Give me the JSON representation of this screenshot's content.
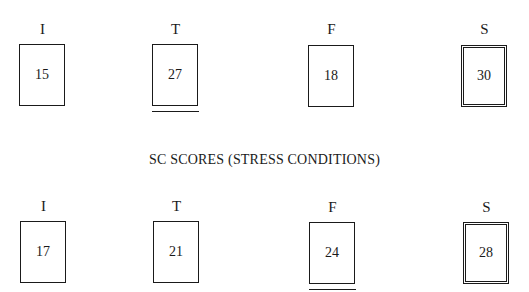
{
  "title": "SC SCORES (STRESS CONDITIONS)",
  "rows": [
    {
      "name": "baseline",
      "items": [
        {
          "label": "I",
          "value": "15",
          "style": "single",
          "underline": false
        },
        {
          "label": "T",
          "value": "27",
          "style": "single",
          "underline": true
        },
        {
          "label": "F",
          "value": "18",
          "style": "single",
          "underline": false
        },
        {
          "label": "S",
          "value": "30",
          "style": "double",
          "underline": false
        }
      ]
    },
    {
      "name": "stress-conditions",
      "items": [
        {
          "label": "I",
          "value": "17",
          "style": "single",
          "underline": false
        },
        {
          "label": "T",
          "value": "21",
          "style": "single",
          "underline": false
        },
        {
          "label": "F",
          "value": "24",
          "style": "single",
          "underline": true
        },
        {
          "label": "S",
          "value": "28",
          "style": "double",
          "underline": false
        }
      ]
    }
  ]
}
